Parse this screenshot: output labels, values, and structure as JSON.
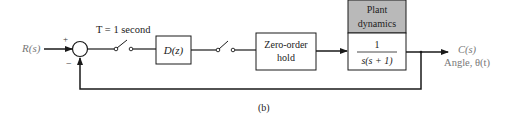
{
  "diagram": {
    "input_label": "R(s)",
    "sum_plus": "+",
    "sum_minus": "−",
    "sampler_label": "T = 1 second",
    "controller_label": "D(z)",
    "zoh_line1": "Zero-order",
    "zoh_line2": "hold",
    "plant_header_line1": "Plant",
    "plant_header_line2": "dynamics",
    "plant_num": "1",
    "plant_den": "s(s + 1)",
    "output_label": "C(s)",
    "output_sublabel": "Angle, θ(t)",
    "caption": "(b)",
    "colors": {
      "line": "#1a1a1a",
      "plant_header_fill": "#b9b9b9",
      "label_gray": "#777777"
    }
  }
}
